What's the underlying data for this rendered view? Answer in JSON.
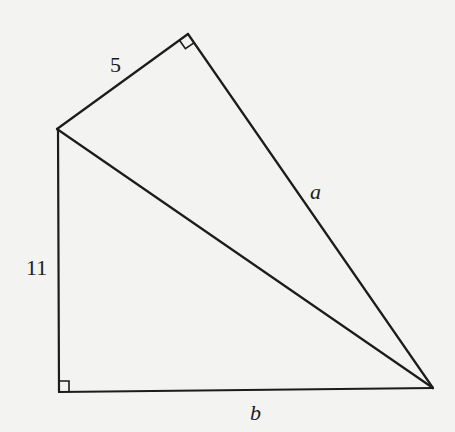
{
  "diagram": {
    "title": "",
    "vertices": {
      "top": {
        "x": 188,
        "y": 34
      },
      "left": {
        "x": 57,
        "y": 129
      },
      "bottom_left": {
        "x": 59,
        "y": 392
      },
      "right": {
        "x": 433,
        "y": 388
      }
    },
    "edges": [
      {
        "from": "left",
        "to": "top",
        "label": "5"
      },
      {
        "from": "top",
        "to": "right",
        "label": "a"
      },
      {
        "from": "left",
        "to": "bottom_left",
        "label": "11"
      },
      {
        "from": "bottom_left",
        "to": "right",
        "label": "b"
      },
      {
        "from": "left",
        "to": "right",
        "label": ""
      }
    ],
    "right_angles": [
      "top",
      "bottom_left"
    ],
    "labels": {
      "side_top_left": "5",
      "side_top_right": "a",
      "side_left": "11",
      "side_bottom": "b"
    },
    "stroke_color": "#1c1c1c",
    "background_color": "#f3f3f1"
  }
}
